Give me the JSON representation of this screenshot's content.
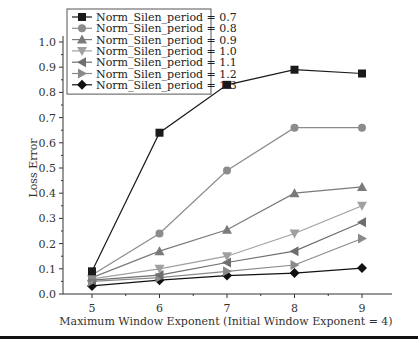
{
  "chart_data": {
    "type": "line",
    "title": "",
    "xlabel": "Maximum Window Exponent (Initial Window Exponent = 4)",
    "ylabel": "Loss Error",
    "x": [
      5,
      6,
      7,
      8,
      9
    ],
    "xticks": [
      "5",
      "6",
      "7",
      "8",
      "9"
    ],
    "xlim": [
      4.6,
      9.5
    ],
    "ylim": [
      0.0,
      1.0
    ],
    "yticks": [
      "0.0",
      "0.1",
      "0.2",
      "0.3",
      "0.4",
      "0.5",
      "0.6",
      "0.7",
      "0.8",
      "0.9",
      "1.0"
    ],
    "grid": false,
    "legend_position": "top-left",
    "series": [
      {
        "name": "Norm_Silen_period = 0.7",
        "marker": "square",
        "color": "#1a1a1a",
        "values": [
          0.09,
          0.64,
          0.83,
          0.89,
          0.875
        ]
      },
      {
        "name": "Norm_Silen_period = 0.8",
        "marker": "circle",
        "color": "#8c8c8c",
        "values": [
          0.075,
          0.24,
          0.49,
          0.66,
          0.66
        ]
      },
      {
        "name": "Norm_Silen_period = 0.9",
        "marker": "triangle-up",
        "color": "#7a7a7a",
        "values": [
          0.065,
          0.17,
          0.255,
          0.4,
          0.425
        ]
      },
      {
        "name": "Norm_Silen_period = 1.0",
        "marker": "triangle-down",
        "color": "#a0a0a0",
        "values": [
          0.06,
          0.1,
          0.15,
          0.24,
          0.35
        ]
      },
      {
        "name": "Norm_Silen_period = 1.1",
        "marker": "triangle-left",
        "color": "#6e6e6e",
        "values": [
          0.055,
          0.075,
          0.125,
          0.17,
          0.285
        ]
      },
      {
        "name": "Norm_Silen_period = 1.2",
        "marker": "triangle-right",
        "color": "#8a8a8a",
        "values": [
          0.05,
          0.065,
          0.09,
          0.115,
          0.22
        ]
      },
      {
        "name": "Norm_Silen_period = 1.3",
        "marker": "diamond",
        "color": "#111111",
        "values": [
          0.032,
          0.055,
          0.073,
          0.083,
          0.103
        ]
      }
    ]
  }
}
